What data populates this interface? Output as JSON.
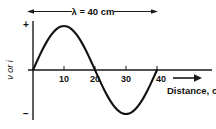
{
  "figure": {
    "background_color": "#ffffff",
    "line_color": "#111111",
    "wavelength_annotation": {
      "label": "λ = 40 cm",
      "arrow_left_name": "left-arrowhead",
      "arrow_right_name": "right-arrowhead"
    },
    "y_axis": {
      "label": "ν or i",
      "positive_sign": "+",
      "negative_sign": "−"
    },
    "x_axis": {
      "title": "Distance, cm",
      "arrow_name": "distance-direction-arrow"
    }
  },
  "chart_data": {
    "type": "line",
    "title": "",
    "subtitle": "",
    "xlabel": "Distance, cm",
    "ylabel": "ν or i",
    "annotations": [
      {
        "text": "λ = 40 cm",
        "position": "top-center",
        "description": "double-headed arrow spanning one full wavelength from 0 to 40 cm"
      },
      {
        "text": "+",
        "position": "y-axis-top",
        "description": "positive polarity marker on vertical axis"
      },
      {
        "text": "−",
        "position": "y-axis-bottom",
        "description": "negative polarity marker on vertical axis"
      }
    ],
    "xlim": [
      0,
      46
    ],
    "ylim": [
      -1.15,
      1.15
    ],
    "xticks": [
      10,
      20,
      30,
      40
    ],
    "xtick_labels": [
      "10",
      "20",
      "30",
      "40"
    ],
    "yticks": [],
    "ytick_labels": [],
    "grid": false,
    "legend": false,
    "legend_position": "none",
    "wavelength_cm": 40,
    "amplitude": 1.0,
    "equation": "y = sin(2*pi*x/40)",
    "series": [
      {
        "name": "ν or i",
        "color": "#111111",
        "x": [
          0,
          1,
          2,
          3,
          4,
          5,
          6,
          7,
          8,
          9,
          10,
          11,
          12,
          13,
          14,
          15,
          16,
          17,
          18,
          19,
          20,
          21,
          22,
          23,
          24,
          25,
          26,
          27,
          28,
          29,
          30,
          31,
          32,
          33,
          34,
          35,
          36,
          37,
          38,
          39,
          40
        ],
        "y": [
          0,
          0.156,
          0.309,
          0.454,
          0.588,
          0.707,
          0.809,
          0.891,
          0.951,
          0.988,
          1.0,
          0.988,
          0.951,
          0.891,
          0.809,
          0.707,
          0.588,
          0.454,
          0.309,
          0.156,
          0.0,
          -0.156,
          -0.309,
          -0.454,
          -0.588,
          -0.707,
          -0.809,
          -0.891,
          -0.951,
          -0.988,
          -1.0,
          -0.988,
          -0.951,
          -0.891,
          -0.809,
          -0.707,
          -0.588,
          -0.454,
          -0.309,
          -0.156,
          0.0
        ]
      }
    ],
    "key_points": {
      "zero_crossings": [
        0,
        20,
        40
      ],
      "peak": {
        "x": 10,
        "y": 1.0
      },
      "trough": {
        "x": 30,
        "y": -1.0
      }
    }
  }
}
